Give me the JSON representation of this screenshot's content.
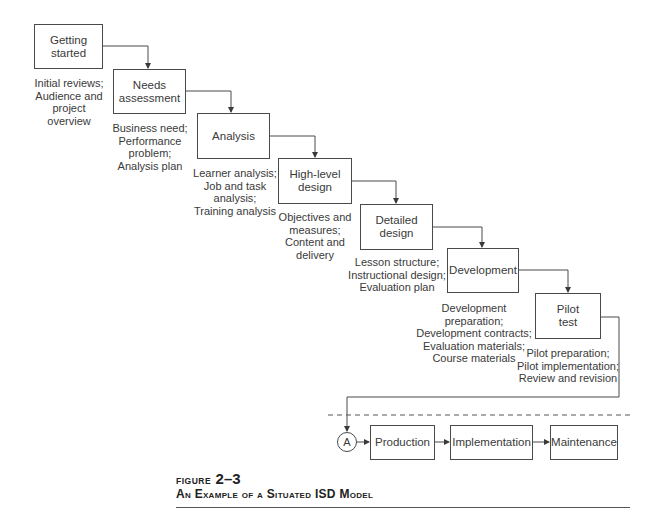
{
  "diagram": {
    "stages": [
      {
        "label": "Getting\nstarted",
        "note": "Initial reviews;\nAudience and\nproject\noverview"
      },
      {
        "label": "Needs\nassessment",
        "note": "Business need;\nPerformance\nproblem;\nAnalysis plan"
      },
      {
        "label": "Analysis",
        "note": "Learner analysis;\nJob and task\nanalysis;\nTraining analysis"
      },
      {
        "label": "High-level\ndesign",
        "note": "Objectives and\nmeasures;\nContent and\ndelivery"
      },
      {
        "label": "Detailed\ndesign",
        "note": "Lesson structure;\nInstructional design;\nEvaluation plan"
      },
      {
        "label": "Development",
        "note": "Development preparation;\nDevelopment contracts;\nEvaluation materials;\nCourse materials"
      },
      {
        "label": "Pilot\ntest",
        "note": "Pilot preparation;\nPilot implementation;\nReview and revision"
      }
    ],
    "connector_label": "A",
    "bottom_stages": [
      {
        "label": "Production"
      },
      {
        "label": "Implementation"
      },
      {
        "label": "Maintenance"
      }
    ]
  },
  "caption": {
    "figure_label": "FIGURE",
    "figure_number": "2–3",
    "title": "An Example of a Situated ISD Model"
  }
}
